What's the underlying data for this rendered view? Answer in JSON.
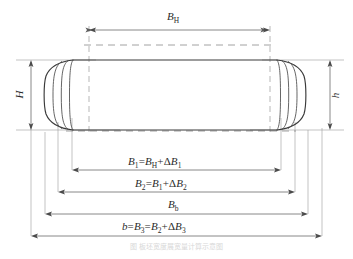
{
  "figure": {
    "caption": "图 板坯宽度展宽量计算示意图",
    "colors": {
      "outline": "#3a3a3a",
      "dimension_line": "#6b6b6b",
      "extension_line": "#8d8d8d",
      "center_line": "#7a7a7a",
      "text": "#2b2b2b",
      "background": "#ffffff"
    },
    "labels": {
      "top_width": "B_H",
      "top_width_base": "B",
      "top_width_sub": "H",
      "left_height": "H",
      "right_height": "h",
      "dim1": "B₁=B_H+ΔB₁",
      "dim2": "B₂=B₁+ΔB₂",
      "dim3": "B_b",
      "dim4": "b=B₃=B₂+ΔB₃"
    },
    "dimensions": [
      {
        "name": "B_H",
        "position": "top",
        "label_parts": [
          {
            "t": "B",
            "style": "italic"
          },
          {
            "t": "H",
            "style": "sub"
          }
        ]
      },
      {
        "name": "H",
        "position": "left",
        "label_parts": [
          {
            "t": "H",
            "style": "italic"
          }
        ]
      },
      {
        "name": "h",
        "position": "right",
        "label_parts": [
          {
            "t": "h",
            "style": "italic"
          }
        ]
      },
      {
        "name": "B1",
        "position": "bottom-1",
        "label_parts": [
          {
            "t": "B",
            "style": "italic"
          },
          {
            "t": "1",
            "style": "sub"
          },
          {
            "t": "=",
            "style": "upright"
          },
          {
            "t": "B",
            "style": "italic"
          },
          {
            "t": "H",
            "style": "sub"
          },
          {
            "t": "+",
            "style": "upright"
          },
          {
            "t": "Δ",
            "style": "upright"
          },
          {
            "t": "B",
            "style": "italic"
          },
          {
            "t": "1",
            "style": "sub"
          }
        ]
      },
      {
        "name": "B2",
        "position": "bottom-2",
        "label_parts": [
          {
            "t": "B",
            "style": "italic"
          },
          {
            "t": "2",
            "style": "sub"
          },
          {
            "t": "=",
            "style": "upright"
          },
          {
            "t": "B",
            "style": "italic"
          },
          {
            "t": "1",
            "style": "sub"
          },
          {
            "t": "+",
            "style": "upright"
          },
          {
            "t": "Δ",
            "style": "upright"
          },
          {
            "t": "B",
            "style": "italic"
          },
          {
            "t": "2",
            "style": "sub"
          }
        ]
      },
      {
        "name": "Bb",
        "position": "bottom-3",
        "label_parts": [
          {
            "t": "B",
            "style": "italic"
          },
          {
            "t": "b",
            "style": "sub"
          }
        ]
      },
      {
        "name": "b",
        "position": "bottom-4",
        "label_parts": [
          {
            "t": "b",
            "style": "italic"
          },
          {
            "t": "=",
            "style": "upright"
          },
          {
            "t": "B",
            "style": "italic"
          },
          {
            "t": "3",
            "style": "sub"
          },
          {
            "t": "=",
            "style": "upright"
          },
          {
            "t": "B",
            "style": "italic"
          },
          {
            "t": "2",
            "style": "sub"
          },
          {
            "t": "+",
            "style": "upright"
          },
          {
            "t": "Δ",
            "style": "upright"
          },
          {
            "t": "B",
            "style": "italic"
          },
          {
            "t": "3",
            "style": "sub"
          }
        ]
      }
    ]
  }
}
